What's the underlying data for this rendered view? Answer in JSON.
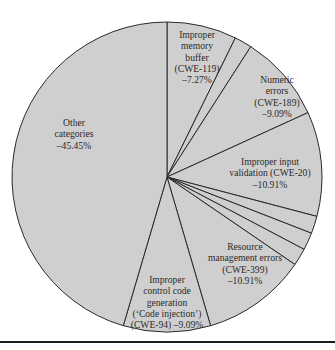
{
  "chart_data": {
    "type": "pie",
    "title": "",
    "start": "top",
    "direction": "clockwise",
    "fill_color": "#cfcfcf",
    "line_color": "#2a2a2a",
    "slices": [
      {
        "name": "Improper memory buffer (CWE-119)",
        "value": 7.27,
        "label_lines": [
          "Improper",
          "memory",
          "buffer",
          "(CWE-119)",
          "–7.27%"
        ]
      },
      {
        "name": "Unlabeled slice 1",
        "value": 1.82,
        "label_lines": []
      },
      {
        "name": "Numeric errors (CWE-189)",
        "value": 9.09,
        "label_lines": [
          "Numeric",
          "errors",
          "(CWE-189)",
          "–9.09%"
        ]
      },
      {
        "name": "Improper input validation (CWE-20)",
        "value": 10.91,
        "label_lines": [
          "Improper input",
          "validation (CWE-20)",
          "–10.91%"
        ]
      },
      {
        "name": "Unlabeled slice 2",
        "value": 1.82,
        "label_lines": []
      },
      {
        "name": "Unlabeled slice 3",
        "value": 1.82,
        "label_lines": []
      },
      {
        "name": "Unlabeled slice 4",
        "value": 1.82,
        "label_lines": []
      },
      {
        "name": "Resource management errors (CWE-399)",
        "value": 10.91,
        "label_lines": [
          "Resource",
          "management errors",
          "(CWE-399)",
          "–10.91%"
        ]
      },
      {
        "name": "Improper control code generation ('Code injection') (CWE-94)",
        "value": 9.09,
        "label_lines": [
          "Improper",
          "control code",
          "generation",
          "(‘Code injection’)",
          "(CWE-94) –9.09%"
        ]
      },
      {
        "name": "Other categories",
        "value": 45.45,
        "label_lines": [
          "Other",
          "categories",
          "–45.45%"
        ]
      }
    ]
  }
}
